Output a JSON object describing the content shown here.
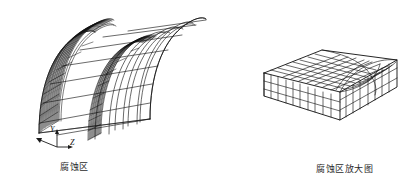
{
  "figure": {
    "background_color": "#ffffff",
    "line_color": "#1a1a1a",
    "dense_mesh_color": "#111111"
  },
  "captions": {
    "left": "腐蚀区",
    "right": "腐蚀区放大图"
  },
  "axes_triad": {
    "y_label": "Y",
    "z_label": "Z",
    "x_label": ""
  },
  "models": {
    "tunnel": {
      "name": "arched-tunnel-mesh",
      "description": "半圆拱形隧道有限元网格",
      "corrosion_band": "left-end dense arch ring"
    },
    "zoom_block": {
      "name": "corrosion-zone-block-mesh",
      "description": "腐蚀区放大的六面体网格块"
    }
  }
}
